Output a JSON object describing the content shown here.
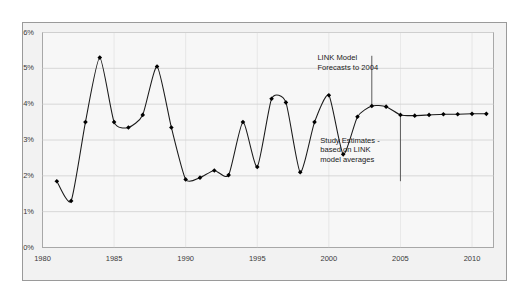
{
  "chart_data": {
    "type": "line",
    "title": "",
    "subtitle": "",
    "xlabel": "",
    "ylabel": "",
    "xlim": [
      1980,
      2011.5
    ],
    "ylim": [
      0,
      6
    ],
    "ytick_labels": [
      "0%",
      "1%",
      "2%",
      "3%",
      "4%",
      "5%",
      "6%"
    ],
    "ytick_values": [
      0,
      1,
      2,
      3,
      4,
      5,
      6
    ],
    "xtick_labels": [
      "1980",
      "1985",
      "1990",
      "1995",
      "2000",
      "2005",
      "2010"
    ],
    "xtick_values": [
      1980,
      1985,
      1990,
      1995,
      2000,
      2005,
      2010
    ],
    "grid": "horizontal",
    "legend": "none",
    "series": [
      {
        "name": "Growth rate",
        "marker": "filled-diamond",
        "line_color": "#1a1a1a",
        "x": [
          1981,
          1982,
          1983,
          1984,
          1985,
          1986,
          1987,
          1988,
          1989,
          1990,
          1991,
          1992,
          1993,
          1994,
          1995,
          1996,
          1997,
          1998,
          1999,
          2000,
          2001,
          2002,
          2003,
          2004,
          2005,
          2006,
          2007,
          2008,
          2009,
          2010,
          2011
        ],
        "values": [
          1.85,
          1.3,
          3.5,
          5.3,
          3.5,
          3.35,
          3.7,
          5.05,
          3.35,
          1.9,
          1.95,
          2.15,
          2.02,
          3.5,
          2.25,
          4.15,
          4.05,
          2.1,
          3.5,
          4.25,
          2.6,
          3.65,
          3.95,
          3.93,
          3.7,
          3.68,
          3.7,
          3.72,
          3.72,
          3.73,
          3.73
        ]
      }
    ],
    "annotations": [
      {
        "name": "link-model-forecast-note",
        "text": "LINK Model\nForecasts to 2004",
        "x": 1999.2,
        "y": 5.25,
        "marker_line": {
          "x": 2003.0,
          "y_from": 5.35,
          "y_to": 3.95
        }
      },
      {
        "name": "study-estimates-note",
        "text": "Study Estimates -\nbased on LINK\nmodel averages",
        "x": 1999.4,
        "y": 2.95,
        "marker_line": {
          "x": 2005.0,
          "y_from": 3.7,
          "y_to": 1.85
        }
      }
    ],
    "colors": {
      "line": "#1a1a1a",
      "marker": "#000000",
      "grid": "#d4d4d4",
      "axis": "#8f8f8f",
      "plot_background": "#f7f7f7",
      "outer_background": "#f2f2f2",
      "page_background": "#ffffff",
      "tick_label": "#3a3a3a",
      "annotation_text": "#1a1a1a"
    }
  }
}
